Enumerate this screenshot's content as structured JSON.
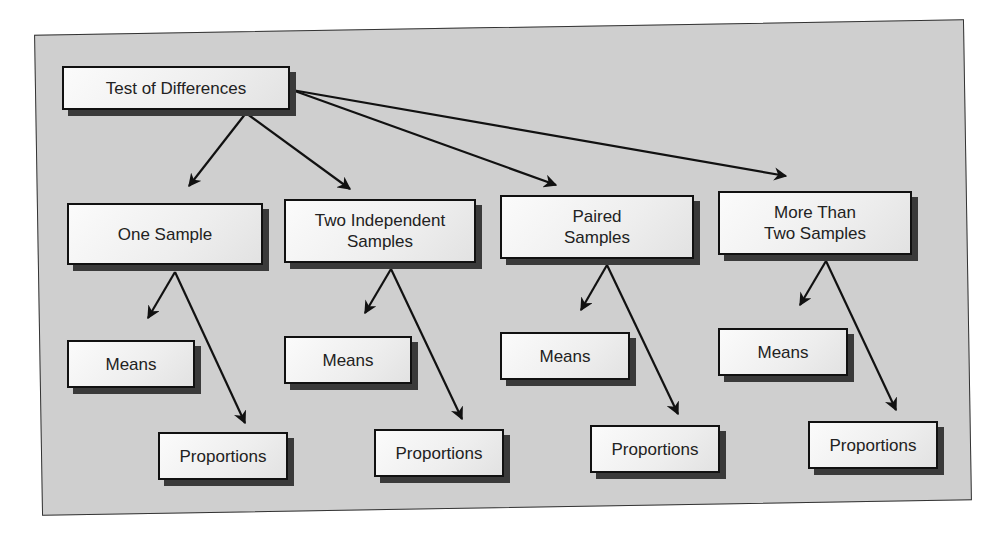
{
  "diagram": {
    "background_color": "#cfcfcf",
    "border_color": "#111111",
    "root": {
      "id": "root",
      "label": "Test of Differences",
      "box": [
        62,
        66,
        228,
        44
      ]
    },
    "categories": [
      {
        "id": "one-sample",
        "label": "One Sample",
        "box": [
          67,
          203,
          196,
          62
        ],
        "children": [
          {
            "id": "one-sample-means",
            "label": "Means",
            "box": [
              67,
              340,
              128,
              48
            ]
          },
          {
            "id": "one-sample-proportions",
            "label": "Proportions",
            "box": [
              158,
              432,
              130,
              48
            ]
          }
        ]
      },
      {
        "id": "two-independent-samples",
        "label": "Two Independent\nSamples",
        "box": [
          284,
          199,
          192,
          64
        ],
        "children": [
          {
            "id": "two-independent-means",
            "label": "Means",
            "box": [
              284,
              336,
              128,
              48
            ]
          },
          {
            "id": "two-independent-proportions",
            "label": "Proportions",
            "box": [
              374,
              429,
              130,
              48
            ]
          }
        ]
      },
      {
        "id": "paired-samples",
        "label": "Paired\nSamples",
        "box": [
          500,
          195,
          194,
          64
        ],
        "children": [
          {
            "id": "paired-means",
            "label": "Means",
            "box": [
              500,
              332,
              130,
              48
            ]
          },
          {
            "id": "paired-proportions",
            "label": "Proportions",
            "box": [
              590,
              425,
              130,
              48
            ]
          }
        ]
      },
      {
        "id": "more-than-two-samples",
        "label": "More Than\nTwo Samples",
        "box": [
          718,
          191,
          194,
          64
        ],
        "children": [
          {
            "id": "more-than-two-means",
            "label": "Means",
            "box": [
              718,
              328,
              130,
              48
            ]
          },
          {
            "id": "more-than-two-proportions",
            "label": "Proportions",
            "box": [
              808,
              421,
              130,
              48
            ]
          }
        ]
      }
    ],
    "edges": [
      {
        "from": "root",
        "to": "one-sample",
        "x1": 246,
        "y1": 113,
        "x2": 189,
        "y2": 186
      },
      {
        "from": "root",
        "to": "two-independent-samples",
        "x1": 246,
        "y1": 113,
        "x2": 350,
        "y2": 189
      },
      {
        "from": "root",
        "to": "paired-samples",
        "x1": 292,
        "y1": 90,
        "x2": 556,
        "y2": 185
      },
      {
        "from": "root",
        "to": "more-than-two-samples",
        "x1": 292,
        "y1": 90,
        "x2": 786,
        "y2": 176
      },
      {
        "from": "one-sample",
        "to": "one-sample-means",
        "x1": 175,
        "y1": 272,
        "x2": 148,
        "y2": 318
      },
      {
        "from": "one-sample",
        "to": "one-sample-proportions",
        "x1": 175,
        "y1": 272,
        "x2": 245,
        "y2": 423
      },
      {
        "from": "two-independent-samples",
        "to": "two-independent-means",
        "x1": 391,
        "y1": 269,
        "x2": 365,
        "y2": 313
      },
      {
        "from": "two-independent-samples",
        "to": "two-independent-proportions",
        "x1": 391,
        "y1": 269,
        "x2": 462,
        "y2": 419
      },
      {
        "from": "paired-samples",
        "to": "paired-means",
        "x1": 607,
        "y1": 265,
        "x2": 581,
        "y2": 310
      },
      {
        "from": "paired-samples",
        "to": "paired-proportions",
        "x1": 607,
        "y1": 265,
        "x2": 678,
        "y2": 414
      },
      {
        "from": "more-than-two-samples",
        "to": "more-than-two-means",
        "x1": 826,
        "y1": 261,
        "x2": 800,
        "y2": 305
      },
      {
        "from": "more-than-two-samples",
        "to": "more-than-two-proportions",
        "x1": 826,
        "y1": 261,
        "x2": 896,
        "y2": 410
      }
    ]
  }
}
